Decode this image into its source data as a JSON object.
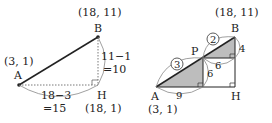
{
  "left": {
    "points": {
      "A": {
        "label": "A",
        "coord": "(3, 1)"
      },
      "B": {
        "label": "B",
        "coord": "(18, 11)"
      },
      "H": {
        "label": "H",
        "coord": "(18, 1)"
      }
    },
    "vertical": {
      "expr": "11−1",
      "result": "=10"
    },
    "horizontal": {
      "expr": "18−3",
      "result": "=15"
    }
  },
  "right": {
    "points": {
      "A": {
        "label": "A",
        "coord": "(3, 1)"
      },
      "B": {
        "label": "B",
        "coord": "(18, 11)"
      },
      "H": {
        "label": "H"
      },
      "P": {
        "label": "P"
      }
    },
    "ratio_ap": "3",
    "ratio_pb": "2",
    "lengths": {
      "a_base": "9",
      "p_height": "6",
      "p_base": "6",
      "b_height": "4"
    }
  },
  "colors": {
    "shade": "#bdbdbd",
    "line": "#222222",
    "arc": "#888888"
  }
}
